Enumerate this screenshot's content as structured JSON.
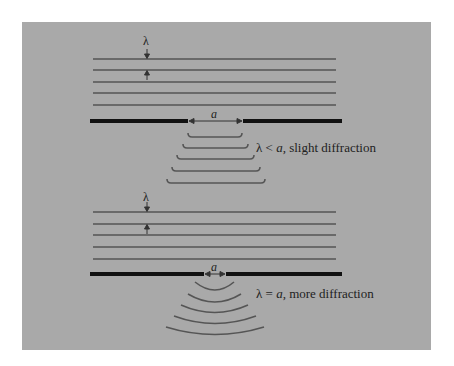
{
  "figure": {
    "background_color": "#a9a9a9",
    "wave_color": "#555555",
    "barrier_color": "#111111",
    "top_panel": {
      "wavelength_symbol": "λ",
      "aperture_symbol": "a",
      "caption_prefix": "λ < ",
      "caption_var": "a",
      "caption_suffix": ", slight diffraction"
    },
    "bottom_panel": {
      "wavelength_symbol": "λ",
      "aperture_symbol": "a",
      "caption_prefix": "λ = ",
      "caption_var": "a",
      "caption_suffix": ", more diffraction"
    }
  }
}
